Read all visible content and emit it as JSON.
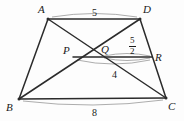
{
  "figure": {
    "kind": "geometry-diagram",
    "shape": "trapezoid-with-diagonals",
    "stroke_color": "#2b2b2b",
    "arc_color": "#8a8a8a",
    "background": "#ffffff"
  },
  "vertices": [
    {
      "id": "A",
      "label": "A",
      "x": 48,
      "y": 19,
      "label_x": 38,
      "label_y": 4
    },
    {
      "id": "D",
      "label": "D",
      "x": 140,
      "y": 19,
      "label_x": 143,
      "label_y": 4
    },
    {
      "id": "B",
      "label": "B",
      "x": 19,
      "y": 99,
      "label_x": 6,
      "label_y": 102
    },
    {
      "id": "C",
      "label": "C",
      "x": 166,
      "y": 98,
      "label_x": 168,
      "label_y": 101
    },
    {
      "id": "P",
      "label": "P",
      "x": 73,
      "y": 57,
      "label_x": 63,
      "label_y": 45
    },
    {
      "id": "Q",
      "label": "Q",
      "x": 101,
      "y": 55,
      "label_x": 101,
      "label_y": 44
    },
    {
      "id": "R",
      "label": "R",
      "x": 152,
      "y": 57,
      "label_x": 155,
      "label_y": 52
    }
  ],
  "segments": [
    {
      "name": "side-AD",
      "from": "A",
      "to": "D"
    },
    {
      "name": "side-BC",
      "from": "B",
      "to": "C"
    },
    {
      "name": "side-AB",
      "from": "A",
      "to": "B"
    },
    {
      "name": "side-DC",
      "from": "D",
      "to": "C"
    },
    {
      "name": "diagonal-AC",
      "from": "A",
      "to": "C"
    },
    {
      "name": "diagonal-BD",
      "from": "B",
      "to": "D"
    },
    {
      "name": "segment-PR",
      "from": "P",
      "to": "R"
    }
  ],
  "measurements": [
    {
      "name": "AD-length",
      "text": "5",
      "x": 92,
      "y": 8,
      "arc": "AD"
    },
    {
      "name": "BC-length",
      "text": "8",
      "x": 92,
      "y": 108,
      "arc": "BC"
    },
    {
      "name": "PQ-length",
      "text": "4",
      "x": 112,
      "y": 70,
      "arc": "PQ"
    },
    {
      "name": "QR-length",
      "numerator": "5",
      "denominator": "2",
      "x": 129,
      "y": 36,
      "arc": "QR"
    }
  ],
  "arcs": [
    {
      "name": "arc-AD",
      "x1": 52,
      "y1": 17,
      "x2": 137,
      "y2": 17,
      "sag": -7
    },
    {
      "name": "arc-BC",
      "x1": 23,
      "y1": 101,
      "x2": 163,
      "y2": 100,
      "sag": 9
    },
    {
      "name": "arc-PQ-lower",
      "x1": 77,
      "y1": 60,
      "x2": 150,
      "y2": 60,
      "sag": 8
    },
    {
      "name": "arc-QR-upper",
      "x1": 104,
      "y1": 56,
      "x2": 150,
      "y2": 56,
      "sag": -5
    },
    {
      "name": "arc-QR-lower",
      "x1": 104,
      "y1": 58,
      "x2": 150,
      "y2": 58,
      "sag": 5
    }
  ]
}
